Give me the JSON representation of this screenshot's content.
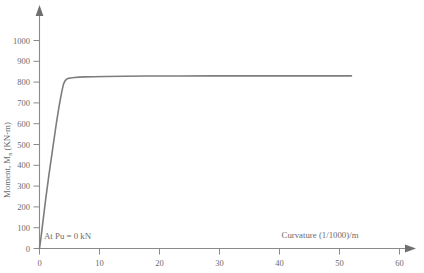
{
  "chart_data": {
    "type": "line",
    "title": "",
    "xlabel": "Curvature (1/1000)/m",
    "ylabel": "Moment, M",
    "ylabel_sub": "n",
    "ylabel_tail": " (KN-m)",
    "xlim": [
      0,
      62
    ],
    "ylim": [
      0,
      1050
    ],
    "grid": false,
    "legend": "none",
    "annotations": [
      {
        "text": "At Pu = 0 kN",
        "x": 1.2,
        "y": 45
      }
    ],
    "xticks": [
      0,
      10,
      20,
      30,
      40,
      50,
      60
    ],
    "xticklabels": [
      "0",
      "10",
      "20",
      "30",
      "40",
      "50",
      "60"
    ],
    "yticks": [
      0,
      100,
      200,
      300,
      400,
      500,
      600,
      700,
      800,
      900,
      1000
    ],
    "yticklabels": [
      "0",
      "100",
      "200",
      "300",
      "400",
      "500",
      "600",
      "700",
      "800",
      "900",
      "1000"
    ],
    "series": [
      {
        "name": "Moment-curvature",
        "color": "#7d7d7d",
        "width": 1.6,
        "x": [
          0.0,
          0.15,
          0.4,
          1.0,
          1.6,
          2.2,
          2.8,
          3.3,
          3.7,
          4.0,
          4.25,
          4.5,
          4.8,
          5.2,
          5.8,
          6.6,
          7.6,
          9.0,
          11.0,
          14.0,
          18.0,
          23.0,
          29.0,
          36.0,
          44.0,
          52.0
        ],
        "y": [
          0,
          30,
          88,
          230,
          360,
          480,
          600,
          690,
          752,
          790,
          806,
          814,
          818,
          820,
          822,
          824,
          825,
          826,
          827,
          828,
          829,
          829,
          830,
          830,
          830,
          830
        ]
      }
    ]
  },
  "axes": {
    "x_axis_name": "curvature-axis",
    "y_axis_name": "moment-axis",
    "axis_color": "#8a8a8a"
  }
}
